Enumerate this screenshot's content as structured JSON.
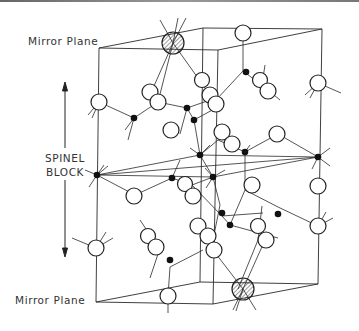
{
  "labels": {
    "mirror_plane_top": "Mirror Plane",
    "mirror_plane_bottom": "Mirror Plane",
    "spinel_line1": "SPINEL",
    "spinel_line2": "BLOCK"
  },
  "legend_semantics": {
    "hatched_circle": "large-cation-on-mirror-plane",
    "open_circle": "oxygen-anion",
    "filled_dot": "small-cation"
  },
  "colors": {
    "line": "#2a2a2a",
    "atom_fill": "#ffffff",
    "dot_fill": "#111111",
    "text": "#333333"
  }
}
